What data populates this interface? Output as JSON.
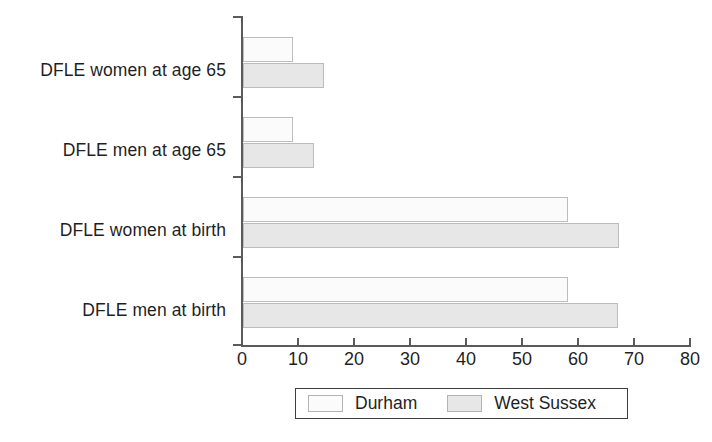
{
  "chart_data": {
    "type": "bar",
    "orientation": "horizontal",
    "title": "",
    "xlabel": "",
    "ylabel": "",
    "xlim": [
      0,
      80
    ],
    "xticks": [
      0,
      10,
      20,
      30,
      40,
      50,
      60,
      70,
      80
    ],
    "xtick_labels": [
      "0",
      "10",
      "20",
      "30",
      "40",
      "50",
      "60",
      "70",
      "80"
    ],
    "grid": false,
    "legend_position": "bottom",
    "categories": [
      "DFLE women at age 65",
      "DFLE men at age 65",
      "DFLE women at birth",
      "DFLE men at birth"
    ],
    "series": [
      {
        "name": "Durham",
        "color": "#fbfbfb",
        "values": [
          8.9,
          8.9,
          58.0,
          58.0
        ]
      },
      {
        "name": "West Sussex",
        "color": "#e7e7e7",
        "values": [
          14.5,
          12.7,
          67.2,
          67.0
        ]
      }
    ]
  },
  "legend": {
    "entries": [
      {
        "label": "Durham",
        "swatch": "durham"
      },
      {
        "label": "West Sussex",
        "swatch": "sussex"
      }
    ]
  }
}
